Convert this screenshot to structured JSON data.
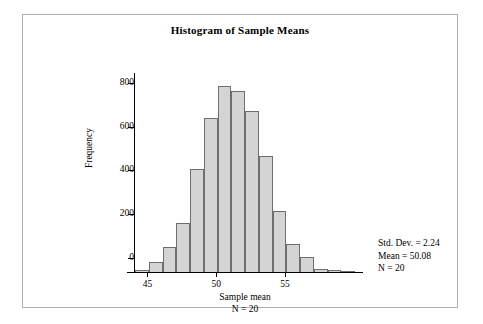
{
  "figure": {
    "title": "Histogram of Sample Means",
    "background": "#ffffff",
    "frame_color": "#b0b0b0"
  },
  "annotation": {
    "std_dev_line": "Std. Dev. = 2.24",
    "mean_line": "Mean = 50.08",
    "n_line": "N = 20"
  },
  "axes": {
    "x_title": "Sample mean",
    "x_subtitle": "N = 20",
    "y_title": "Frequency"
  },
  "chart_data": {
    "type": "bar",
    "title": "Histogram of Sample Means",
    "xlabel": "Sample mean",
    "ylabel": "Frequency",
    "xlim": [
      42.5,
      58.5
    ],
    "ylim": [
      0,
      900
    ],
    "grid": false,
    "legend": null,
    "bar_fill": "#d4d4d4",
    "bar_edge": "#6e6e6e",
    "bin_width": 1,
    "x_ticks": [
      45,
      50,
      55
    ],
    "y_ticks": [
      0,
      200,
      400,
      600,
      800
    ],
    "bin_centers": [
      43,
      44,
      45,
      46,
      47,
      48,
      49,
      50,
      51,
      52,
      53,
      54,
      55,
      56,
      57,
      58
    ],
    "categories": [
      "43",
      "44",
      "45",
      "46",
      "47",
      "48",
      "49",
      "50",
      "51",
      "52",
      "53",
      "54",
      "55",
      "56",
      "57",
      "58"
    ],
    "values": [
      10,
      45,
      115,
      225,
      470,
      705,
      850,
      825,
      735,
      530,
      280,
      130,
      70,
      15,
      8,
      5
    ],
    "statistics": {
      "std_dev": 2.24,
      "mean": 50.08,
      "n": 20
    }
  }
}
